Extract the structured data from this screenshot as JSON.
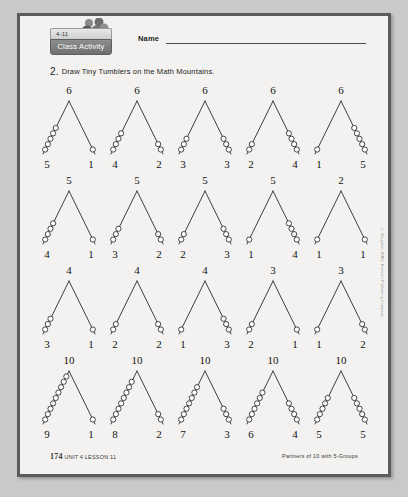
{
  "header": {
    "badge_number": "4-11",
    "badge_label": "Class Activity",
    "name_label": "Name",
    "tumbler_icon": "tumbler-figures-icon"
  },
  "instruction": {
    "number": "2.",
    "text": "Draw Tiny Tumblers on the Math Mountains."
  },
  "side_copyright": "© Houghton Mifflin Harcourt Publishing Company",
  "footer": {
    "page": "174",
    "unit_lesson": "UNIT 4 LESSON 11",
    "topic": "Partners of 10 with 5-Groups"
  },
  "colors": {
    "page_background": "#f3f2f0",
    "page_border": "#5b5b5b",
    "outer_background": "#c9c9c7",
    "ink": "#141414",
    "badge_bar": "#6f6f6f"
  },
  "chart_data": {
    "type": "diagram",
    "title": "Math Mountains",
    "rows": [
      {
        "total": 6,
        "mountains": [
          {
            "total": 6,
            "left": 5,
            "right": 1
          },
          {
            "total": 6,
            "left": 4,
            "right": 2
          },
          {
            "total": 6,
            "left": 3,
            "right": 3
          },
          {
            "total": 6,
            "left": 2,
            "right": 4
          },
          {
            "total": 6,
            "left": 1,
            "right": 5
          }
        ]
      },
      {
        "total": 5,
        "mountains": [
          {
            "total": 5,
            "left": 4,
            "right": 1
          },
          {
            "total": 5,
            "left": 3,
            "right": 2
          },
          {
            "total": 5,
            "left": 2,
            "right": 3
          },
          {
            "total": 5,
            "left": 1,
            "right": 4
          },
          {
            "total": 2,
            "left": 1,
            "right": 1
          }
        ]
      },
      {
        "total": 4,
        "mountains": [
          {
            "total": 4,
            "left": 3,
            "right": 1
          },
          {
            "total": 4,
            "left": 2,
            "right": 2
          },
          {
            "total": 4,
            "left": 1,
            "right": 3
          },
          {
            "total": 3,
            "left": 2,
            "right": 1
          },
          {
            "total": 3,
            "left": 1,
            "right": 2
          }
        ]
      },
      {
        "total": 10,
        "mountains": [
          {
            "total": 10,
            "left": 9,
            "right": 1
          },
          {
            "total": 10,
            "left": 8,
            "right": 2
          },
          {
            "total": 10,
            "left": 7,
            "right": 3
          },
          {
            "total": 10,
            "left": 6,
            "right": 4
          },
          {
            "total": 10,
            "left": 5,
            "right": 5
          }
        ]
      }
    ]
  }
}
